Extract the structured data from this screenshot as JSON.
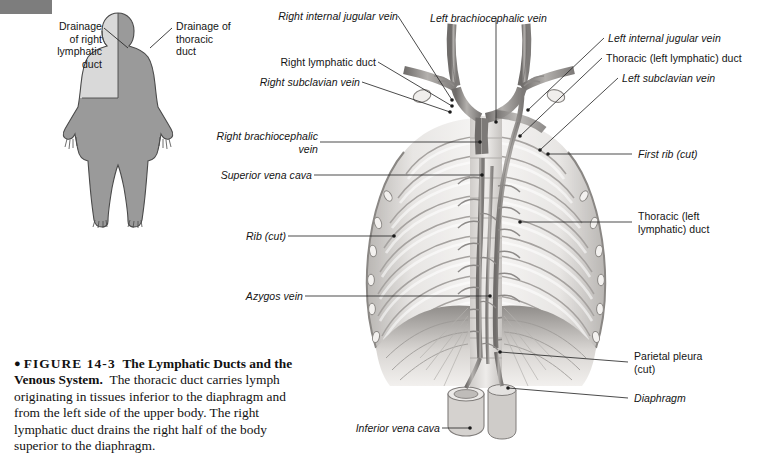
{
  "figure": {
    "number_label": "FIGURE 14-3",
    "title": "The Lymphatic Ducts and the Venous System.",
    "body": "The thoracic duct carries lymph originating in tissues inferior to the diaphragm and from the left side of the upper body. The right lymphatic duct drains the right half of the body superior to the diaphragm.",
    "bullet_glyph": "●"
  },
  "inset": {
    "labels": [
      {
        "id": "drainage-right-lymphatic-duct",
        "text": "Drainage\nof right\nlymphatic\nduct",
        "align": "right",
        "italic": false
      },
      {
        "id": "drainage-thoracic-duct",
        "text": "Drainage of\nthoracic\nduct",
        "align": "left",
        "italic": false
      }
    ],
    "colors": {
      "right_lymphatic_region": "#d9d9d9",
      "thoracic_duct_region": "#9a9a9a",
      "outline": "#4a4a4a"
    }
  },
  "illustration": {
    "labels_left": [
      {
        "id": "right-internal-jugular-vein",
        "text": "Right internal jugular vein",
        "italic": true
      },
      {
        "id": "right-lymphatic-duct",
        "text": "Right lymphatic duct",
        "italic": false
      },
      {
        "id": "right-subclavian-vein",
        "text": "Right subclavian vein",
        "italic": true
      },
      {
        "id": "right-brachiocephalic-vein",
        "text": "Right brachiocephalic\nvein",
        "italic": true
      },
      {
        "id": "superior-vena-cava",
        "text": "Superior vena cava",
        "italic": true
      },
      {
        "id": "rib-cut",
        "text": "Rib (cut)",
        "italic": true
      },
      {
        "id": "azygos-vein",
        "text": "Azygos vein",
        "italic": true
      },
      {
        "id": "inferior-vena-cava",
        "text": "Inferior vena cava",
        "italic": true
      }
    ],
    "labels_right": [
      {
        "id": "left-brachiocephalic-vein",
        "text": "Left brachiocephalic vein",
        "italic": true
      },
      {
        "id": "left-internal-jugular-vein",
        "text": "Left internal jugular vein",
        "italic": true
      },
      {
        "id": "thoracic-left-lymphatic-duct-top",
        "text": "Thoracic (left lymphatic) duct",
        "italic": false
      },
      {
        "id": "left-subclavian-vein",
        "text": "Left subclavian vein",
        "italic": true
      },
      {
        "id": "first-rib-cut",
        "text": "First rib (cut)",
        "italic": true
      },
      {
        "id": "thoracic-left-lymphatic-duct-mid",
        "text": "Thoracic (left\nlymphatic) duct",
        "italic": false
      },
      {
        "id": "parietal-pleura-cut",
        "text": "Parietal pleura\n(cut)",
        "italic": false
      },
      {
        "id": "diaphragm",
        "text": "Diaphragm",
        "italic": true
      }
    ],
    "colors": {
      "leader_line": "#2b2b2b",
      "bone_light": "#eceae8",
      "bone_mid": "#c9c6c3",
      "bone_dark": "#9d9a97",
      "vessel": "#8f8c8a",
      "background_tint": "#f4f3f2"
    }
  }
}
